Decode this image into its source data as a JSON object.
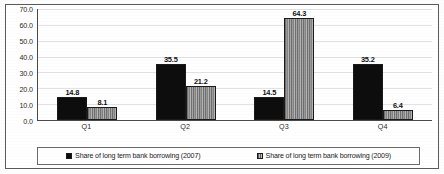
{
  "chart_data": {
    "type": "bar",
    "title": "",
    "xlabel": "",
    "ylabel": "",
    "categories": [
      "Q1",
      "Q2",
      "Q3",
      "Q4"
    ],
    "series": [
      {
        "name": "Share of long term bank borrowing (2007)",
        "values": [
          14.8,
          35.5,
          14.5,
          35.2
        ],
        "labels": [
          "14.8",
          "35.5",
          "14.5",
          "35.2"
        ],
        "color": "#0d0d0d",
        "pattern": "solid"
      },
      {
        "name": "Share of long term bank borrowing (2009)",
        "values": [
          8.1,
          21.2,
          64.3,
          6.4
        ],
        "labels": [
          "8.1",
          "21.2",
          "64.3",
          "6.4"
        ],
        "color": "#8a8a8a",
        "pattern": "vertical-stripes"
      }
    ],
    "ylim": [
      0,
      70
    ],
    "ytick_values": [
      0,
      10,
      20,
      30,
      40,
      50,
      60,
      70
    ],
    "ytick_labels": [
      "0.0",
      "10.0",
      "20.0",
      "30.0",
      "40.0",
      "50.0",
      "60.0",
      "70.0"
    ],
    "grid": true,
    "legend_position": "bottom",
    "data_labels": true
  },
  "legend": {
    "entries": [
      {
        "label": "Share of long term bank borrowing (2007)",
        "marker": "filled-square-icon"
      },
      {
        "label": "Share of long term bank borrowing (2009)",
        "marker": "striped-square-icon"
      }
    ]
  }
}
